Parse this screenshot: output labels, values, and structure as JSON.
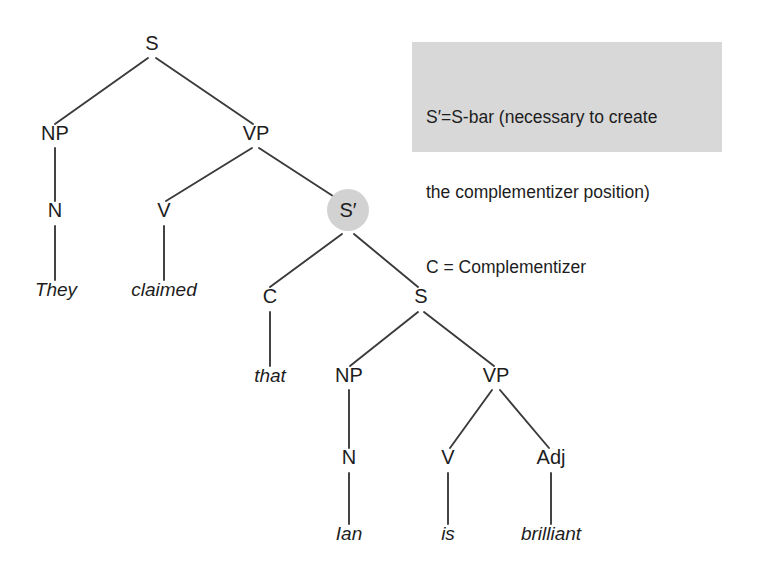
{
  "figure": {
    "type": "syntax-tree-diagram",
    "background_color": "#ffffff",
    "line_color": "#3a3a3a",
    "text_color": "#1d1d1d"
  },
  "legend": {
    "background_color": "#d8d8d8",
    "lines": [
      "S′=S-bar (necessary to create",
      "the complementizer position)",
      "C = Complementizer"
    ]
  },
  "tree": {
    "sentence": "They claimed that Ian is brilliant",
    "highlight": {
      "node": "S′",
      "shape": "circle",
      "color": "#d2d2d2"
    },
    "nodes": [
      {
        "id": "S_root",
        "label": "S",
        "x": 152,
        "y": 50,
        "kind": "category"
      },
      {
        "id": "NP1",
        "label": "NP",
        "x": 55,
        "y": 140,
        "kind": "category"
      },
      {
        "id": "VP1",
        "label": "VP",
        "x": 256,
        "y": 140,
        "kind": "category"
      },
      {
        "id": "N1",
        "label": "N",
        "x": 55,
        "y": 217,
        "kind": "category"
      },
      {
        "id": "V1",
        "label": "V",
        "x": 164,
        "y": 217,
        "kind": "category"
      },
      {
        "id": "SBAR",
        "label": "S′",
        "x": 348,
        "y": 217,
        "kind": "category-highlighted"
      },
      {
        "id": "They",
        "label": "They",
        "x": 56,
        "y": 296,
        "kind": "word"
      },
      {
        "id": "claimed",
        "label": "claimed",
        "x": 164,
        "y": 296,
        "kind": "word"
      },
      {
        "id": "C1",
        "label": "C",
        "x": 270,
        "y": 303,
        "kind": "category"
      },
      {
        "id": "S_emb",
        "label": "S",
        "x": 421,
        "y": 303,
        "kind": "category"
      },
      {
        "id": "that",
        "label": "that",
        "x": 270,
        "y": 382,
        "kind": "word"
      },
      {
        "id": "NP2",
        "label": "NP",
        "x": 349,
        "y": 382,
        "kind": "category"
      },
      {
        "id": "VP2",
        "label": "VP",
        "x": 496,
        "y": 382,
        "kind": "category"
      },
      {
        "id": "N2",
        "label": "N",
        "x": 349,
        "y": 464,
        "kind": "category"
      },
      {
        "id": "V2",
        "label": "V",
        "x": 448,
        "y": 464,
        "kind": "category"
      },
      {
        "id": "Adj1",
        "label": "Adj",
        "x": 551,
        "y": 464,
        "kind": "category"
      },
      {
        "id": "Ian",
        "label": "Ian",
        "x": 349,
        "y": 540,
        "kind": "word"
      },
      {
        "id": "is",
        "label": "is",
        "x": 448,
        "y": 540,
        "kind": "word"
      },
      {
        "id": "brilliant",
        "label": "brilliant",
        "x": 551,
        "y": 540,
        "kind": "word"
      }
    ],
    "edges": [
      {
        "from": "S_root",
        "to": "NP1",
        "x1": 148,
        "y1": 58,
        "x2": 55,
        "y2": 124
      },
      {
        "from": "S_root",
        "to": "VP1",
        "x1": 156,
        "y1": 58,
        "x2": 253,
        "y2": 124
      },
      {
        "from": "NP1",
        "to": "N1",
        "x1": 55,
        "y1": 148,
        "x2": 55,
        "y2": 201
      },
      {
        "from": "N1",
        "to": "They",
        "x1": 55,
        "y1": 226,
        "x2": 55,
        "y2": 280
      },
      {
        "from": "VP1",
        "to": "V1",
        "x1": 252,
        "y1": 148,
        "x2": 166,
        "y2": 201
      },
      {
        "from": "VP1",
        "to": "SBAR",
        "x1": 259,
        "y1": 148,
        "x2": 336,
        "y2": 198
      },
      {
        "from": "V1",
        "to": "claimed",
        "x1": 164,
        "y1": 226,
        "x2": 164,
        "y2": 280
      },
      {
        "from": "SBAR",
        "to": "C1",
        "x1": 342,
        "y1": 234,
        "x2": 270,
        "y2": 287
      },
      {
        "from": "SBAR",
        "to": "S_emb",
        "x1": 354,
        "y1": 234,
        "x2": 418,
        "y2": 287
      },
      {
        "from": "C1",
        "to": "that",
        "x1": 270,
        "y1": 312,
        "x2": 270,
        "y2": 366
      },
      {
        "from": "S_emb",
        "to": "NP2",
        "x1": 418,
        "y1": 312,
        "x2": 350,
        "y2": 366
      },
      {
        "from": "S_emb",
        "to": "VP2",
        "x1": 424,
        "y1": 312,
        "x2": 494,
        "y2": 366
      },
      {
        "from": "NP2",
        "to": "N2",
        "x1": 349,
        "y1": 390,
        "x2": 349,
        "y2": 448
      },
      {
        "from": "N2",
        "to": "Ian",
        "x1": 349,
        "y1": 473,
        "x2": 349,
        "y2": 524
      },
      {
        "from": "VP2",
        "to": "V2",
        "x1": 492,
        "y1": 390,
        "x2": 450,
        "y2": 448
      },
      {
        "from": "VP2",
        "to": "Adj1",
        "x1": 500,
        "y1": 390,
        "x2": 549,
        "y2": 448
      },
      {
        "from": "V2",
        "to": "is",
        "x1": 448,
        "y1": 473,
        "x2": 448,
        "y2": 524
      },
      {
        "from": "Adj1",
        "to": "brilliant",
        "x1": 551,
        "y1": 473,
        "x2": 551,
        "y2": 524
      }
    ]
  }
}
